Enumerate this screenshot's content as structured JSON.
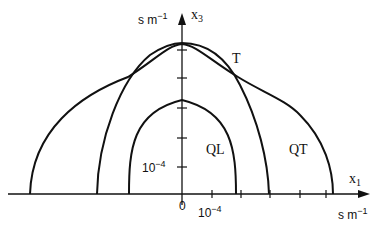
{
  "diagram": {
    "type": "slowness-surface-section",
    "axes": {
      "horizontal": {
        "label": "x",
        "subscript": "1",
        "unit": "s m",
        "unit_exp": "−1"
      },
      "vertical": {
        "label": "x",
        "subscript": "3",
        "unit": "s m",
        "unit_exp": "−1"
      },
      "origin_label": "0",
      "h_tick_label": {
        "base": "10",
        "exp": "−4"
      },
      "v_tick_label": {
        "base": "10",
        "exp": "−4"
      }
    },
    "curves": [
      {
        "name": "QL",
        "label": "QL"
      },
      {
        "name": "QT",
        "label": "QT"
      },
      {
        "name": "T",
        "label": "T"
      }
    ],
    "colors": {
      "ink": "#111111",
      "background": "#ffffff"
    }
  }
}
